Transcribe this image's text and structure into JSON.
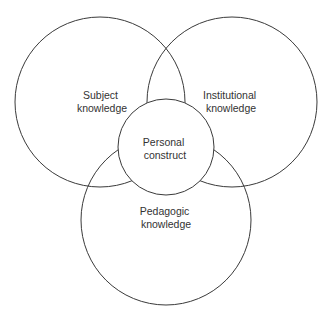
{
  "diagram": {
    "type": "venn",
    "colors": {
      "stroke": "#3a3a3a",
      "text": "#333333",
      "background": "#ffffff"
    },
    "circles": [
      {
        "id": "subject",
        "label_lines": [
          "Subject",
          "knowledge"
        ],
        "cx": 100,
        "cy": 102,
        "r": 85
      },
      {
        "id": "institutional",
        "label_lines": [
          "Institutional",
          "knowledge"
        ],
        "cx": 232,
        "cy": 102,
        "r": 85
      },
      {
        "id": "pedagogic",
        "label_lines": [
          "Pedagogic",
          "knowledge"
        ],
        "cx": 166,
        "cy": 220,
        "r": 85
      },
      {
        "id": "personal",
        "label_lines": [
          "Personal",
          "construct"
        ],
        "cx": 166,
        "cy": 147,
        "r": 48
      }
    ]
  }
}
